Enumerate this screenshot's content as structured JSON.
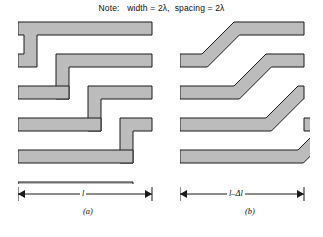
{
  "figure": {
    "note": "Note:   width = 2λ,  spacing = 2λ",
    "note_prefix": "Note:",
    "note_width_term": "width = 2λ",
    "note_spacing_term": "spacing = 2λ",
    "stroke_color": "#1a1a1a",
    "fill_color": "#bcbcbc",
    "background_color": "#ffffff",
    "trace_width_lambda": 2,
    "trace_spacing_lambda": 2
  },
  "panels": [
    {
      "id": "a",
      "caption": "(a)",
      "bend_type": "square-90-degree",
      "dimension_label": "l",
      "dimension_from_x": 0,
      "dimension_to_x": 134,
      "description": "Meander line with right-angle bends"
    },
    {
      "id": "b",
      "caption": "(b)",
      "bend_type": "mitered-45-degree",
      "dimension_label": "l–Δl",
      "dimension_from_x": 0,
      "dimension_to_x": 124,
      "description": "Meander line with 45 degree mitered bends, shorter overall length"
    }
  ],
  "geometry": {
    "band_thickness": 13,
    "vertical_pitch": 32,
    "panel_a": {
      "bands": [
        "M 6,4 L 134,4 L 134,17 L 19,17 L 19,49 L 6,49 Z",
        "M 38,36 L 134,36 L 134,49 L 51,49 L 51,81 L 38,81 Z",
        "M 70,68 L 134,68 L 134,81 L 83,81 L 83,113 L 70,113 Z",
        "M 102,100 L 134,100 L 134,113 L 115,113 L 115,145 L 102,145 Z",
        "M 0,81 L 19,81 L 19,94 L 0,94 Z",
        "M 0,113 L 51,113 L 51,126 L 0,126 Z",
        "M 0,145 L 83,145 L 83,158 L 0,158 Z"
      ],
      "simple_bands": [
        {
          "type": "zigzag",
          "rows": 4
        }
      ]
    },
    "panel_b": {
      "bands": [
        "M 28,4 L 124,4 L 124,17 L 41,17 L 22,49 L 6,49 Z"
      ]
    }
  }
}
